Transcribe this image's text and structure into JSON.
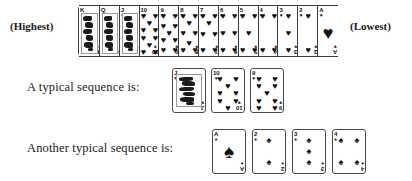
{
  "labels": {
    "highest": "(Highest)",
    "lowest": "(Lowest)"
  },
  "sequences": [
    {
      "text": "A typical sequence is:",
      "cards": [
        {
          "rank": "J",
          "suit": "hearts",
          "suit_symbol": "♥",
          "pips": 0,
          "face": true
        },
        {
          "rank": "10",
          "suit": "hearts",
          "suit_symbol": "♥",
          "pips": 10,
          "face": false
        },
        {
          "rank": "9",
          "suit": "hearts",
          "suit_symbol": "♥",
          "pips": 9,
          "face": false
        }
      ]
    },
    {
      "text": "Another typical sequence is:",
      "cards": [
        {
          "rank": "A",
          "suit": "spades",
          "suit_symbol": "♠",
          "pips": 1,
          "face": false
        },
        {
          "rank": "2",
          "suit": "spades",
          "suit_symbol": "♠",
          "pips": 2,
          "face": false
        },
        {
          "rank": "3",
          "suit": "spades",
          "suit_symbol": "♠",
          "pips": 3,
          "face": false
        },
        {
          "rank": "4",
          "suit": "spades",
          "suit_symbol": "♠",
          "pips": 4,
          "face": false
        }
      ]
    }
  ],
  "rank_strip": {
    "suit": "hearts",
    "suit_symbol": "♥",
    "cards": [
      {
        "rank": "K",
        "pips": 0,
        "face": true
      },
      {
        "rank": "Q",
        "pips": 0,
        "face": true
      },
      {
        "rank": "J",
        "pips": 0,
        "face": true
      },
      {
        "rank": "10",
        "pips": 10,
        "face": false
      },
      {
        "rank": "9",
        "pips": 9,
        "face": false
      },
      {
        "rank": "8",
        "pips": 8,
        "face": false
      },
      {
        "rank": "7",
        "pips": 7,
        "face": false
      },
      {
        "rank": "6",
        "pips": 6,
        "face": false
      },
      {
        "rank": "5",
        "pips": 5,
        "face": false
      },
      {
        "rank": "4",
        "pips": 4,
        "face": false
      },
      {
        "rank": "3",
        "pips": 3,
        "face": false
      },
      {
        "rank": "2",
        "pips": 2,
        "face": false
      },
      {
        "rank": "A",
        "pips": 1,
        "face": false
      }
    ]
  },
  "colors": {
    "background": "#ffffff",
    "ink": "#1a1a1a",
    "card_border": "#4a4a4a",
    "pip": "#111111"
  }
}
